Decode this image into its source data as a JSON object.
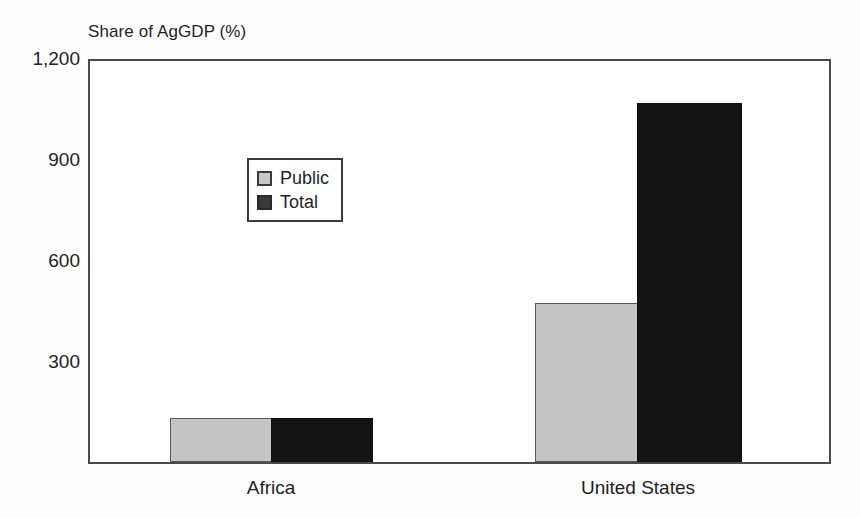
{
  "chart_data": {
    "type": "bar",
    "title": "Share of AgGDP (%)",
    "xlabel": "",
    "ylabel": "Share of AgGDP (%)",
    "categories": [
      "Africa",
      "United States"
    ],
    "series": [
      {
        "name": "Public",
        "values": [
          131,
          475
        ]
      },
      {
        "name": "Total",
        "values": [
          131,
          1075
        ]
      }
    ],
    "ylim": [
      0,
      1200
    ],
    "yticks": [
      0,
      300,
      600,
      900,
      1200
    ],
    "ytick_labels": [
      "",
      "300",
      "600",
      "900",
      "1,200"
    ],
    "grid": false,
    "legend_position": "upper left",
    "legend_entries": [
      "Public",
      "Total"
    ],
    "colors": {
      "public": "#c4c4c4",
      "total": "#141414",
      "axis": "#4a4a4a",
      "text": "#1f1f1f"
    }
  },
  "axis": {
    "tick_1200": "1,200",
    "tick_900": "900",
    "tick_600": "600",
    "tick_300": "300"
  },
  "legend": {
    "public_label": "Public",
    "total_label": "Total"
  },
  "categories": {
    "africa": "Africa",
    "united_states": "United States"
  }
}
